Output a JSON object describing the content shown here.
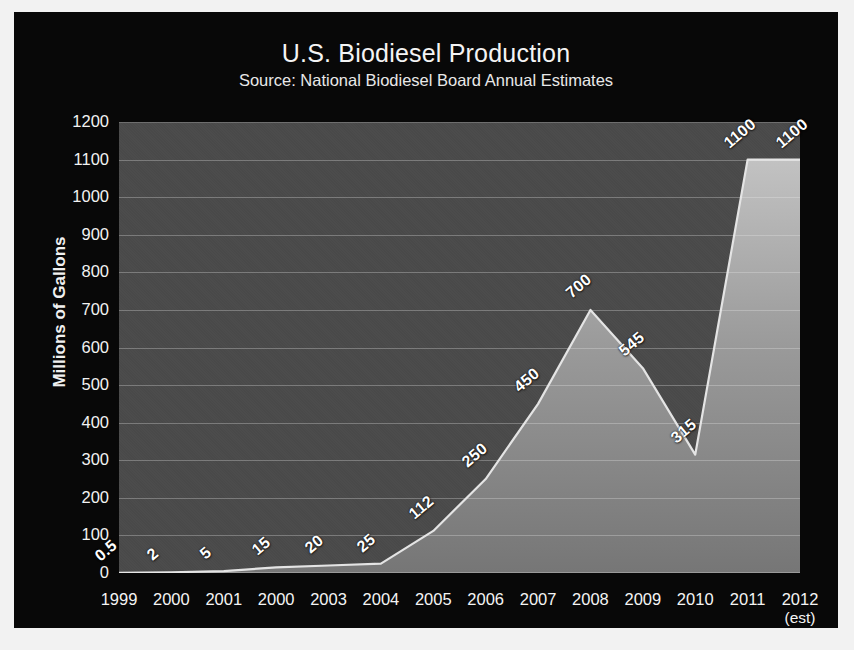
{
  "chart_data": {
    "type": "area",
    "title": "U.S. Biodiesel Production",
    "subtitle": "Source: National Biodiesel Board Annual Estimates",
    "xlabel": "",
    "ylabel": "Millions of Gallons",
    "ylim": [
      0,
      1200
    ],
    "ytick_values": [
      0,
      100,
      200,
      300,
      400,
      500,
      600,
      700,
      800,
      900,
      1000,
      1100,
      1200
    ],
    "ytick_labels": [
      "0",
      "100",
      "200",
      "300",
      "400",
      "500",
      "600",
      "700",
      "800",
      "900",
      "1000",
      "1100",
      "1200"
    ],
    "grid": true,
    "legend": "none",
    "categories": [
      "1999",
      "2000",
      "2001",
      "2000",
      "2003",
      "2004",
      "2005",
      "2006",
      "2007",
      "2008",
      "2009",
      "2010",
      "2011",
      "2012"
    ],
    "xtick_sublabels": [
      "",
      "",
      "",
      "",
      "",
      "",
      "",
      "",
      "",
      "",
      "",
      "",
      "",
      "(est)"
    ],
    "values": [
      0.5,
      2,
      5,
      15,
      20,
      25,
      112,
      250,
      450,
      700,
      545,
      315,
      1100,
      1100
    ],
    "value_labels": [
      "0.5",
      "2",
      "5",
      "15",
      "20",
      "25",
      "112",
      "250",
      "450",
      "700",
      "545",
      "315",
      "1100",
      "1100"
    ],
    "colors": {
      "card_background": "#080808",
      "plot_background": "#4a4a4a",
      "area_fill_top": "#b9b9b9",
      "area_fill_bottom": "#7d7d7d",
      "area_line": "#e6e6e6",
      "gridline": "#ebebeb",
      "text": "#f4f4f4",
      "value_label": "#ffffff",
      "page_background": "#f2f2f2"
    }
  }
}
